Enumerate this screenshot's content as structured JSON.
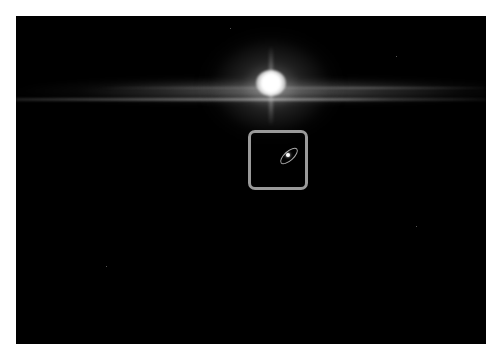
{
  "image": {
    "description": "Astronomical image: bright star with horizontal lens streak, faint tilted galaxy highlighted by rounded square box",
    "background_color": "#000000",
    "border_color": "#ffffff",
    "highlight_box_color": "#9a9a9a",
    "objects": [
      {
        "name": "bright-star",
        "position": [
          271,
          84
        ]
      },
      {
        "name": "horizontal-light-streak",
        "y": 98
      },
      {
        "name": "highlighted-galaxy",
        "position": [
          288,
          157
        ],
        "box": [
          248,
          130,
          308,
          190
        ]
      }
    ]
  }
}
